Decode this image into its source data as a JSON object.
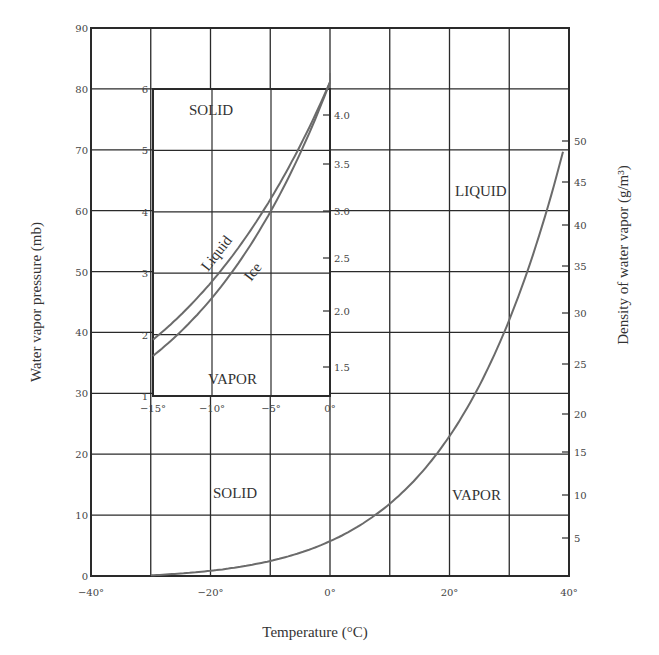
{
  "chart_data": {
    "type": "line",
    "title": "",
    "xlabel": "Temperature (°C)",
    "ylabel": "Water vapor pressure (mb)",
    "y2label": "Density of water vapor (g/m³)",
    "xlim": [
      -40,
      40
    ],
    "ylim": [
      0,
      90
    ],
    "grid": true,
    "x_ticks": [
      "−40°",
      "−20°",
      "0°",
      "20°",
      "40°"
    ],
    "y_ticks": [
      "0",
      "10",
      "20",
      "30",
      "40",
      "50",
      "60",
      "70",
      "80",
      "90"
    ],
    "y2_ticks": [
      "5",
      "10",
      "15",
      "20",
      "25",
      "30",
      "35",
      "40",
      "45",
      "50"
    ],
    "series": [
      {
        "name": "Saturation vapor pressure curve",
        "x": [
          -30,
          -20,
          -10,
          0,
          10,
          20,
          30,
          40
        ],
        "values": [
          0.4,
          1.9,
          3.8,
          7.5,
          13.5,
          23.5,
          42.5,
          73.5
        ]
      }
    ],
    "region_labels": [
      "LIQUID",
      "SOLID",
      "VAPOR"
    ],
    "inset": {
      "type": "line",
      "xlim": [
        -15,
        0
      ],
      "ylim": [
        1,
        6
      ],
      "x_ticks": [
        "−15°",
        "−10°",
        "−5°",
        "0°"
      ],
      "y_ticks": [
        "1",
        "2",
        "3",
        "4",
        "5",
        "6"
      ],
      "y2_ticks": [
        "1.5",
        "2.0",
        "2.5",
        "3.0",
        "3.5",
        "4.0"
      ],
      "region_labels": [
        "SOLID",
        "VAPOR"
      ],
      "series": [
        {
          "name": "Liquid",
          "x": [
            -15,
            -10,
            -5,
            0
          ],
          "values": [
            1.9,
            2.9,
            4.2,
            6.1
          ]
        },
        {
          "name": "Ice",
          "x": [
            -15,
            -10,
            -5,
            0
          ],
          "values": [
            1.65,
            2.6,
            4.0,
            6.1
          ]
        }
      ]
    }
  },
  "labels": {
    "xlabel": "Temperature (°C)",
    "ylabel": "Water vapor pressure (mb)",
    "y2label": "Density of water vapor (g/m³)",
    "main_liquid": "LIQUID",
    "main_solid": "SOLID",
    "main_vapor": "VAPOR",
    "inset_solid": "SOLID",
    "inset_vapor": "VAPOR",
    "inset_liquid_curve": "Liquid",
    "inset_ice_curve": "Ice"
  },
  "colors": {
    "grid": "#2a2a2a",
    "curve": "#6b6b6b",
    "text": "#333333"
  }
}
